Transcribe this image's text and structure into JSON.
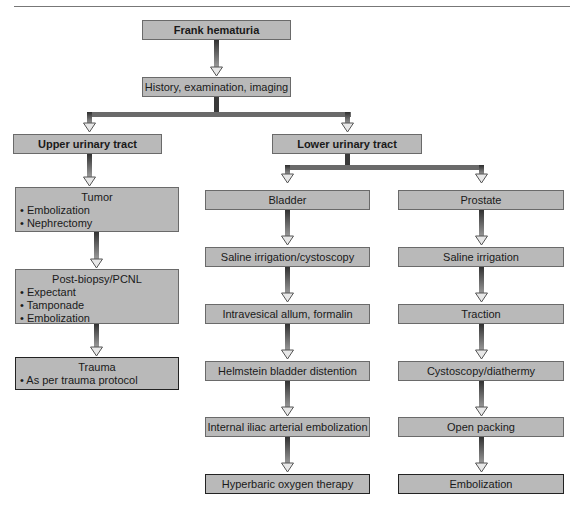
{
  "diagram": {
    "root": "Frank hematuria",
    "step1": "History, examination, imaging",
    "upper": {
      "label": "Upper urinary tract",
      "tumor": {
        "title": "Tumor",
        "items": [
          "Embolization",
          "Nephrectomy"
        ]
      },
      "post_biopsy": {
        "title": "Post-biopsy/PCNL",
        "items": [
          "Expectant",
          "Tamponade",
          "Embolization"
        ]
      },
      "trauma": {
        "title": "Trauma",
        "items": [
          "As per trauma protocol"
        ]
      }
    },
    "lower": {
      "label": "Lower urinary tract",
      "bladder": {
        "label": "Bladder",
        "steps": [
          "Saline irrigation/cystoscopy",
          "Intravesical allum, formalin",
          "Helmstein bladder distention",
          "Internal iliac arterial embolization",
          "Hyperbaric oxygen therapy"
        ]
      },
      "prostate": {
        "label": "Prostate",
        "steps": [
          "Saline irrigation",
          "Traction",
          "Cystoscopy/diathermy",
          "Open packing",
          "Embolization"
        ]
      }
    },
    "colors": {
      "box_fill": "#b9b9b9",
      "box_border": "#6a6a6a",
      "arrow_dark": "#3a3a3a",
      "arrow_head": "#e6e6e6"
    }
  }
}
